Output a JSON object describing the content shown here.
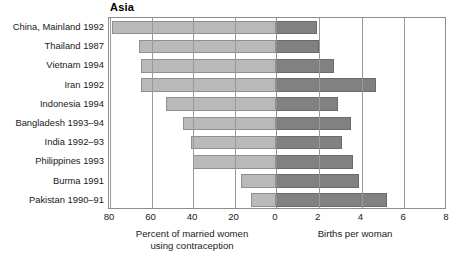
{
  "chart_data": {
    "type": "bar",
    "title": "Asia",
    "orientation": "horizontal",
    "layout": "bidirectional-pyramid",
    "grid": true,
    "legend_position": "none",
    "categories": [
      "China, Mainland 1992",
      "Thailand 1987",
      "Vietnam 1994",
      "Iran 1992",
      "Indonesia 1994",
      "Bangladesh 1993–94",
      "India 1992–93",
      "Philippines 1993",
      "Burma 1991",
      "Pakistan 1990–91"
    ],
    "series": [
      {
        "name": "Percent of married women using contraception",
        "side": "left",
        "color": "#b9b9b9",
        "xlabel": "Percent of married women\nusing contraception",
        "xlim": [
          0,
          80
        ],
        "ticks": [
          80,
          60,
          40,
          20,
          0
        ],
        "values": [
          79,
          66,
          65,
          65,
          53,
          45,
          41,
          40,
          17,
          12
        ]
      },
      {
        "name": "Births per woman",
        "side": "right",
        "color": "#818181",
        "xlabel": "Births per woman",
        "xlim": [
          0,
          8
        ],
        "ticks": [
          0,
          2,
          4,
          6,
          8
        ],
        "values": [
          1.9,
          2.0,
          2.7,
          4.7,
          2.9,
          3.5,
          3.1,
          3.6,
          3.9,
          5.2
        ]
      }
    ]
  },
  "axes": {
    "left": {
      "title_line1": "Percent of married women",
      "title_line2": "using contraception",
      "tick_labels": [
        "80",
        "60",
        "40",
        "20",
        "0"
      ]
    },
    "right": {
      "title_line1": "Births per woman",
      "title_line2": "",
      "tick_labels": [
        "0",
        "2",
        "4",
        "6",
        "8"
      ]
    }
  },
  "colors": {
    "bar_left": "#b9b9b9",
    "bar_left_border": "#8f8f8f",
    "bar_right": "#818181",
    "bar_right_border": "#6a6a6a",
    "grid": "#9a9a9a",
    "frame": "#8d8d8d",
    "background": "#ffffff",
    "text": "#1a1a1a"
  }
}
